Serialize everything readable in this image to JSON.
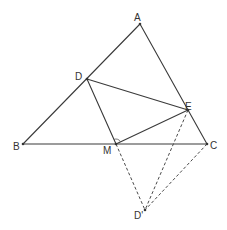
{
  "diagram": {
    "type": "geometry",
    "points": {
      "A": {
        "label": "A",
        "x": 140,
        "y": 24,
        "lx": 134,
        "ly": 21
      },
      "B": {
        "label": "B",
        "x": 23,
        "y": 144,
        "lx": 13,
        "ly": 150
      },
      "C": {
        "label": "C",
        "x": 207,
        "y": 144,
        "lx": 210,
        "ly": 149
      },
      "D": {
        "label": "D",
        "x": 87,
        "y": 79,
        "lx": 75,
        "ly": 80
      },
      "E": {
        "label": "E",
        "x": 188,
        "y": 110,
        "lx": 185,
        "ly": 110
      },
      "M": {
        "label": "M",
        "x": 116,
        "y": 144,
        "lx": 103,
        "ly": 154
      },
      "D_prime": {
        "label": "D'",
        "x": 145,
        "y": 210,
        "lx": 134,
        "ly": 219
      }
    },
    "solid_segments": [
      [
        "A",
        "B"
      ],
      [
        "A",
        "C"
      ],
      [
        "B",
        "C"
      ],
      [
        "D",
        "E"
      ],
      [
        "D",
        "M"
      ],
      [
        "M",
        "E"
      ]
    ],
    "dashed_segments": [
      [
        "M",
        "D_prime"
      ],
      [
        "E",
        "D_prime"
      ],
      [
        "C",
        "D_prime"
      ]
    ],
    "right_angle_marker": {
      "at": "M",
      "between": [
        "D",
        "E"
      ]
    },
    "colors": {
      "stroke": "#3a3a3a",
      "background": "#ffffff"
    }
  }
}
